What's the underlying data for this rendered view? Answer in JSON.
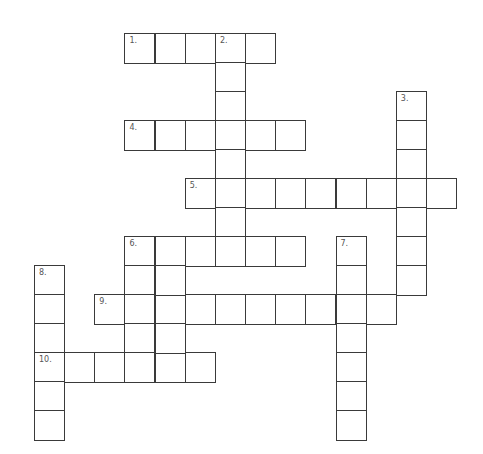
{
  "puzzle": {
    "type": "crossword",
    "origin_x": 34,
    "origin_y": 33,
    "col_step": 30.15,
    "row_step": 29.0,
    "cell_size": 30,
    "colors": {
      "line": "#3a3a3a",
      "number": "#555555",
      "background": "#ffffff"
    },
    "words": [
      {
        "number": "1.",
        "direction": "across",
        "row": 0,
        "col": 3,
        "length": 5
      },
      {
        "number": "2.",
        "direction": "down",
        "row": 0,
        "col": 6,
        "length": 8
      },
      {
        "number": "3.",
        "direction": "down",
        "row": 2,
        "col": 12,
        "length": 7
      },
      {
        "number": "4.",
        "direction": "across",
        "row": 3,
        "col": 3,
        "length": 6
      },
      {
        "number": "5.",
        "direction": "across",
        "row": 5,
        "col": 5,
        "length": 9
      },
      {
        "number": "6.",
        "direction": "across",
        "row": 7,
        "col": 3,
        "length": 6
      },
      {
        "number": "6d",
        "label": "",
        "direction": "down",
        "row": 7,
        "col": 3,
        "length": 5
      },
      {
        "number": "7.",
        "direction": "down",
        "row": 7,
        "col": 10,
        "length": 7
      },
      {
        "number": "8.",
        "direction": "down",
        "row": 8,
        "col": 0,
        "length": 6
      },
      {
        "number": "9.",
        "direction": "across",
        "row": 9,
        "col": 2,
        "length": 10
      },
      {
        "number": "10.",
        "direction": "across",
        "row": 11,
        "col": 0,
        "length": 6
      }
    ],
    "extra_cells": [
      {
        "row": 8,
        "col": 4
      },
      {
        "row": 9,
        "col": 4
      },
      {
        "row": 10,
        "col": 4
      }
    ]
  }
}
